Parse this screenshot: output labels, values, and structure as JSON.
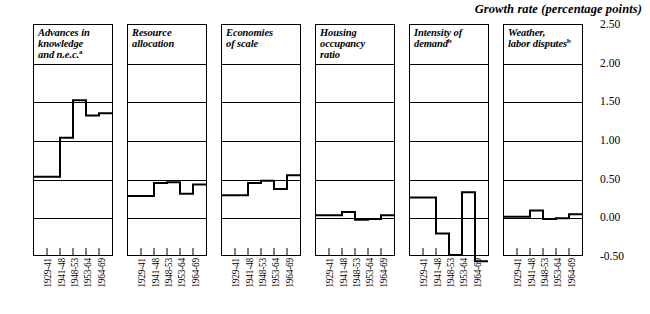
{
  "chart_data": {
    "type": "line",
    "title": "Growth rate (percentage points)",
    "xlabel": "",
    "ylabel": "Growth rate (percentage points)",
    "ylim": [
      -0.5,
      2.5
    ],
    "yticks": [
      2.5,
      2.0,
      1.5,
      1.0,
      0.5,
      0.0,
      -0.5
    ],
    "ytick_labels": [
      "2.50",
      "2.00",
      "1.50",
      "1.00",
      "0.50",
      "0.00",
      "-0.50"
    ],
    "grid": true,
    "legend": "none",
    "step_style": "step-post",
    "categories": [
      "1929-41",
      "1941-48",
      "1948-53",
      "1953-64",
      "1964-69"
    ],
    "panels": [
      {
        "name": "advances-in-knowledge",
        "label": "Advances in knowledge and n.e.c.",
        "label_lines": [
          "Advances in",
          "knowledge",
          "and n.e.c."
        ],
        "footnote_marker": "a",
        "values": [
          0.52,
          0.52,
          1.03,
          1.52,
          1.32,
          1.35
        ]
      },
      {
        "name": "resource-allocation",
        "label": "Resource allocation",
        "label_lines": [
          "Resource",
          "allocation"
        ],
        "footnote_marker": "",
        "values": [
          0.27,
          0.27,
          0.44,
          0.45,
          0.3,
          0.42
        ]
      },
      {
        "name": "economies-of-scale",
        "label": "Economies of scale",
        "label_lines": [
          "Economies",
          "of scale"
        ],
        "footnote_marker": "",
        "values": [
          0.28,
          0.28,
          0.44,
          0.47,
          0.36,
          0.54
        ]
      },
      {
        "name": "housing-occupancy-ratio",
        "label": "Housing occupancy ratio",
        "label_lines": [
          "Housing",
          "occupancy",
          "ratio"
        ],
        "footnote_marker": "",
        "values": [
          0.02,
          0.02,
          0.06,
          -0.04,
          -0.03,
          0.02
        ]
      },
      {
        "name": "intensity-of-demand",
        "label": "Intensity of demand",
        "label_lines": [
          "Intensity of",
          "demand"
        ],
        "footnote_marker": "b",
        "values": [
          0.25,
          0.25,
          -0.22,
          -0.5,
          0.32,
          -0.58
        ]
      },
      {
        "name": "weather-labor-disputes",
        "label": "Weather, labor disputes",
        "label_lines": [
          "Weather,",
          "labor disputes"
        ],
        "footnote_marker": "b",
        "values": [
          0.0,
          0.0,
          0.08,
          -0.03,
          -0.02,
          0.03
        ]
      }
    ]
  }
}
